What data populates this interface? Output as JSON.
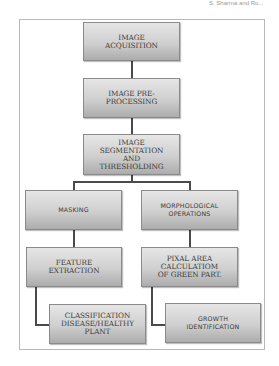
{
  "header_text": "S. Sharma and Ro...",
  "diagram": {
    "nodes": [
      {
        "id": "image-acquisition",
        "label": "IMAGE\nACQUISITION"
      },
      {
        "id": "image-preprocessing",
        "label": "IMAGE PRE-\nPROCESSING"
      },
      {
        "id": "image-segmentation",
        "label": "IMAGE\nSEGMENTATION\nAND\nTHRESHOLDING"
      },
      {
        "id": "masking",
        "label": "MASKING"
      },
      {
        "id": "morphological-operations",
        "label": "MORPHOLOGICAL\nOPERATIONS"
      },
      {
        "id": "feature-extraction",
        "label": "FEATURE\nEXTRACTION"
      },
      {
        "id": "pixal-area",
        "label": "PIXAL AREA\nCALCULATIOM\nOF GREEN PART."
      },
      {
        "id": "classification",
        "label": "CLASSIFICATION\nDISEASE/HEALTHY\nPLANT"
      },
      {
        "id": "growth-identification",
        "label": "GROWTH\nIDENTIFICATION"
      }
    ],
    "edges": [
      {
        "from": "image-acquisition",
        "to": "image-preprocessing"
      },
      {
        "from": "image-preprocessing",
        "to": "image-segmentation"
      },
      {
        "from": "image-segmentation",
        "to": "masking"
      },
      {
        "from": "image-segmentation",
        "to": "morphological-operations"
      },
      {
        "from": "masking",
        "to": "feature-extraction"
      },
      {
        "from": "morphological-operations",
        "to": "pixal-area"
      },
      {
        "from": "feature-extraction",
        "to": "classification"
      },
      {
        "from": "pixal-area",
        "to": "growth-identification"
      }
    ]
  }
}
